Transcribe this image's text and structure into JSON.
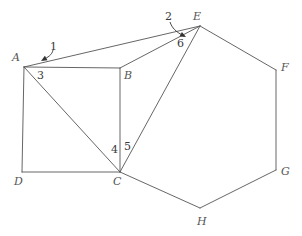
{
  "figure": {
    "canvas": {
      "width": 302,
      "height": 236,
      "background": "#ffffff"
    },
    "style": {
      "stroke_color": "#555555",
      "stroke_width": 0.9,
      "label_color": "#555555",
      "angle_label_color": "#3a3a3a",
      "arrow_color": "#333333"
    },
    "points": {
      "A": {
        "x": 24,
        "y": 67,
        "label": "A",
        "label_x": 12,
        "label_y": 52
      },
      "B": {
        "x": 120,
        "y": 68,
        "label": "B",
        "label_x": 124,
        "label_y": 70
      },
      "C": {
        "x": 120,
        "y": 172,
        "label": "C",
        "label_x": 113,
        "label_y": 176
      },
      "D": {
        "x": 22,
        "y": 172,
        "label": "D",
        "label_x": 14,
        "label_y": 176
      },
      "E": {
        "x": 200,
        "y": 26,
        "label": "E",
        "label_x": 193,
        "label_y": 11
      },
      "F": {
        "x": 276,
        "y": 70,
        "label": "F",
        "label_x": 281,
        "label_y": 62
      },
      "G": {
        "x": 276,
        "y": 170,
        "label": "G",
        "label_x": 281,
        "label_y": 166
      },
      "H": {
        "x": 200,
        "y": 208,
        "label": "H",
        "label_x": 197,
        "label_y": 216
      }
    },
    "segments": [
      {
        "name": "segment-A-B",
        "from": "A",
        "to": "B"
      },
      {
        "name": "segment-B-C",
        "from": "B",
        "to": "C"
      },
      {
        "name": "segment-C-D",
        "from": "C",
        "to": "D"
      },
      {
        "name": "segment-D-A",
        "from": "D",
        "to": "A"
      },
      {
        "name": "segment-A-C-diagonal",
        "from": "A",
        "to": "C"
      },
      {
        "name": "segment-A-E",
        "from": "A",
        "to": "E"
      },
      {
        "name": "segment-B-E",
        "from": "B",
        "to": "E"
      },
      {
        "name": "segment-C-E",
        "from": "C",
        "to": "E"
      },
      {
        "name": "segment-E-F",
        "from": "E",
        "to": "F"
      },
      {
        "name": "segment-F-G",
        "from": "F",
        "to": "G"
      },
      {
        "name": "segment-G-H",
        "from": "G",
        "to": "H"
      },
      {
        "name": "segment-H-C",
        "from": "H",
        "to": "C"
      }
    ],
    "angle_labels": [
      {
        "id": "1",
        "text": "1",
        "x": 50,
        "y": 41,
        "vertex": "A",
        "note": "angle between AE and AB at A, outer"
      },
      {
        "id": "2",
        "text": "2",
        "x": 165,
        "y": 11,
        "vertex": "E",
        "note": "angle at E between AE and BE"
      },
      {
        "id": "3",
        "text": "3",
        "x": 37,
        "y": 70,
        "vertex": "A",
        "note": "angle between AB and AC at A"
      },
      {
        "id": "4",
        "text": "4",
        "x": 111,
        "y": 144,
        "vertex": "C",
        "note": "angle between CA and CB at C"
      },
      {
        "id": "5",
        "text": "5",
        "x": 124,
        "y": 141,
        "vertex": "C",
        "note": "angle between CB and CE at C"
      },
      {
        "id": "6",
        "text": "6",
        "x": 177,
        "y": 38,
        "vertex": "E",
        "note": "angle at E between BE and CE"
      }
    ],
    "leaders": [
      {
        "name": "leader-label-1",
        "path": "M 53 50 C 52 55, 48 57, 43 60",
        "arrow_at": {
          "x": 41,
          "y": 61
        },
        "arrow_angle_deg": 150
      },
      {
        "name": "leader-label-2",
        "path": "M 170 22 C 172 28, 176 32, 184 36",
        "arrow_at": {
          "x": 186,
          "y": 37
        },
        "arrow_angle_deg": 28
      }
    ]
  }
}
